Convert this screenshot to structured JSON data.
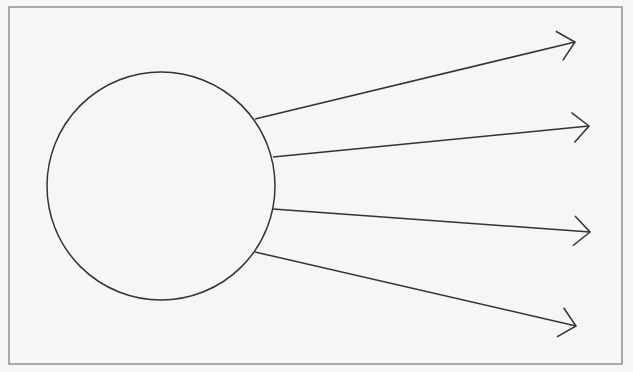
{
  "diagram": {
    "colors": {
      "background": "#f6f6f6",
      "stroke": "#333333",
      "frame": "#777777"
    },
    "frame": {
      "x": 9,
      "y": 7,
      "width": 613,
      "height": 357
    },
    "circle": {
      "cx": 161,
      "cy": 186,
      "r": 114
    },
    "arrows": [
      {
        "x1": 255,
        "y1": 119,
        "x2": 575,
        "y2": 42
      },
      {
        "x1": 273,
        "y1": 157,
        "x2": 589,
        "y2": 126
      },
      {
        "x1": 273,
        "y1": 209,
        "x2": 590,
        "y2": 232
      },
      {
        "x1": 255,
        "y1": 252,
        "x2": 576,
        "y2": 326
      }
    ]
  }
}
